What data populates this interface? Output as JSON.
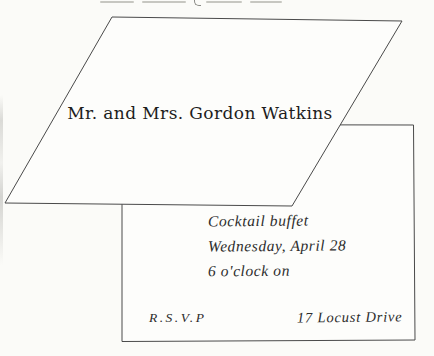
{
  "page": {
    "background_color": "#fbfbf8",
    "line_color": "#4a4a4a",
    "ink_color": "#2c2c2c"
  },
  "invitation_card": {
    "name_line": "Mr. and Mrs. Gordon Watkins"
  },
  "reply_card": {
    "handwritten_lines": [
      "Cocktail buffet",
      "Wednesday, April 28",
      "6 o'clock on"
    ],
    "rsvp_label": "R.S.V.P",
    "address": "17 Locust Drive"
  }
}
